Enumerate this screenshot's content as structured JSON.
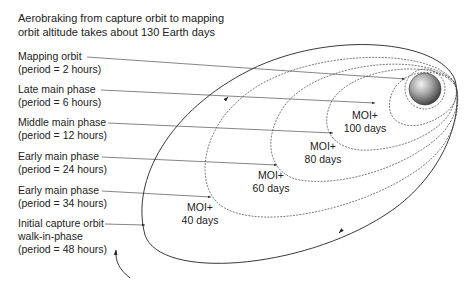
{
  "title": {
    "line1": "Aerobraking from capture orbit to mapping",
    "line2": "orbit altitude takes about 130 Earth days"
  },
  "phases": [
    {
      "name": "Mapping orbit",
      "period": "(period = 2 hours)"
    },
    {
      "name": "Late main phase",
      "period": "(period = 6 hours)"
    },
    {
      "name": "Middle main phase",
      "period": "(period = 12 hours)"
    },
    {
      "name": "Early main phase",
      "period": "(period = 24 hours)"
    },
    {
      "name": "Early main phase",
      "period": "(period = 34 hours)"
    },
    {
      "name": "Initial capture orbit",
      "name2": "walk-in-phase",
      "period": "(period = 48 hours)"
    }
  ],
  "moi_labels": [
    {
      "line1": "MOI+",
      "line2": "100 days"
    },
    {
      "line1": "MOI+",
      "line2": "80 days"
    },
    {
      "line1": "MOI+",
      "line2": "60 days"
    },
    {
      "line1": "MOI+",
      "line2": "40 days"
    }
  ],
  "planet": {
    "name": "planet-sphere",
    "color": "#8a8a8a"
  }
}
